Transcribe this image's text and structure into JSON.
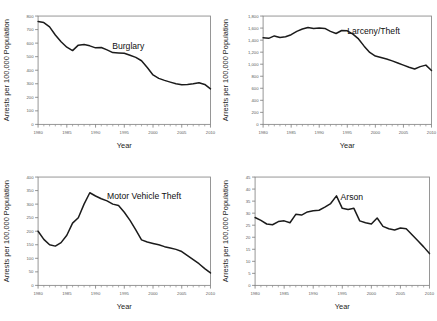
{
  "figure": {
    "background_color": "#ffffff",
    "line_color": "#1b1b1b",
    "axis_color": "#7a7a7a"
  },
  "chart_data": [
    {
      "type": "line",
      "title": "Burglary",
      "xlabel": "Year",
      "ylabel": "Arrests per 100,000 Population",
      "xlim": [
        1980,
        2010
      ],
      "ylim": [
        0,
        800
      ],
      "xticks": [
        1980,
        1985,
        1990,
        1995,
        2000,
        2005,
        2010
      ],
      "xtick_labels": [
        "1980",
        "1985",
        "1990",
        "1995",
        "2000",
        "2005",
        "2010"
      ],
      "yticks": [
        0,
        100,
        200,
        300,
        400,
        500,
        600,
        700,
        800
      ],
      "ytick_labels": [
        "0",
        "100",
        "200",
        "300",
        "400",
        "500",
        "600",
        "700",
        "800"
      ],
      "grid": false,
      "legend": "none",
      "x": [
        1980,
        1981,
        1982,
        1983,
        1984,
        1985,
        1986,
        1987,
        1988,
        1989,
        1990,
        1991,
        1992,
        1993,
        1994,
        1995,
        1996,
        1997,
        1998,
        1999,
        2000,
        2001,
        2002,
        2003,
        2004,
        2005,
        2006,
        2007,
        2008,
        2009,
        2010
      ],
      "values": [
        760,
        752,
        720,
        660,
        610,
        570,
        545,
        585,
        590,
        580,
        565,
        568,
        550,
        530,
        528,
        525,
        510,
        495,
        470,
        420,
        365,
        340,
        325,
        312,
        300,
        292,
        295,
        300,
        308,
        295,
        262
      ]
    },
    {
      "type": "line",
      "title": "Larceny/Theft",
      "xlabel": "Year",
      "ylabel": "Arrests per 100,000 Population",
      "xlim": [
        1980,
        2010
      ],
      "ylim": [
        0,
        1800
      ],
      "xticks": [
        1980,
        1985,
        1990,
        1995,
        2000,
        2005,
        2010
      ],
      "xtick_labels": [
        "1980",
        "1985",
        "1990",
        "1995",
        "2000",
        "2005",
        "2010"
      ],
      "yticks": [
        0,
        200,
        400,
        600,
        800,
        1000,
        1200,
        1400,
        1600,
        1800
      ],
      "ytick_labels": [
        "0",
        "200",
        "400",
        "600",
        "800",
        "1,000",
        "1,200",
        "1,400",
        "1,600",
        "1,800"
      ],
      "grid": false,
      "legend": "none",
      "x": [
        1980,
        1981,
        1982,
        1983,
        1984,
        1985,
        1986,
        1987,
        1988,
        1989,
        1990,
        1991,
        1992,
        1993,
        1994,
        1995,
        1996,
        1997,
        1998,
        1999,
        2000,
        2001,
        2002,
        2003,
        2004,
        2005,
        2006,
        2007,
        2008,
        2009,
        2010
      ],
      "values": [
        1440,
        1430,
        1470,
        1445,
        1455,
        1490,
        1545,
        1585,
        1610,
        1595,
        1600,
        1595,
        1545,
        1510,
        1560,
        1555,
        1500,
        1420,
        1300,
        1195,
        1135,
        1110,
        1085,
        1055,
        1020,
        985,
        950,
        920,
        960,
        985,
        895
      ]
    },
    {
      "type": "line",
      "title": "Motor Vehicle Theft",
      "xlabel": "Year",
      "ylabel": "Arrests per 100,000 Population",
      "xlim": [
        1980,
        2010
      ],
      "ylim": [
        0,
        400
      ],
      "xticks": [
        1980,
        1985,
        1990,
        1995,
        2000,
        2005,
        2010
      ],
      "xtick_labels": [
        "1980",
        "1985",
        "1990",
        "1995",
        "2000",
        "2005",
        "2010"
      ],
      "yticks": [
        0,
        50,
        100,
        150,
        200,
        250,
        300,
        350,
        400
      ],
      "ytick_labels": [
        "0",
        "50",
        "100",
        "150",
        "200",
        "250",
        "300",
        "350",
        "400"
      ],
      "grid": false,
      "legend": "none",
      "x": [
        1980,
        1981,
        1982,
        1983,
        1984,
        1985,
        1986,
        1987,
        1988,
        1989,
        1990,
        1991,
        1992,
        1993,
        1994,
        1995,
        1996,
        1997,
        1998,
        1999,
        2000,
        2001,
        2002,
        2003,
        2004,
        2005,
        2006,
        2007,
        2008,
        2009,
        2010
      ],
      "values": [
        200,
        170,
        150,
        145,
        158,
        185,
        230,
        250,
        300,
        342,
        330,
        320,
        312,
        300,
        295,
        270,
        240,
        205,
        168,
        160,
        155,
        150,
        143,
        138,
        133,
        125,
        110,
        95,
        80,
        62,
        46
      ]
    },
    {
      "type": "line",
      "title": "Arson",
      "xlabel": "Year",
      "ylabel": "Arrests per 100,000 Population",
      "xlim": [
        1980,
        2010
      ],
      "ylim": [
        0,
        45
      ],
      "xticks": [
        1980,
        1985,
        1990,
        1995,
        2000,
        2005,
        2010
      ],
      "xtick_labels": [
        "1980",
        "1985",
        "1990",
        "1995",
        "2000",
        "2005",
        "2010"
      ],
      "yticks": [
        0,
        5,
        10,
        15,
        20,
        25,
        30,
        35,
        40,
        45
      ],
      "ytick_labels": [
        "0",
        "5",
        "10",
        "15",
        "20",
        "25",
        "30",
        "35",
        "40",
        "45"
      ],
      "grid": false,
      "legend": "none",
      "x": [
        1980,
        1981,
        1982,
        1983,
        1984,
        1985,
        1986,
        1987,
        1988,
        1989,
        1990,
        1991,
        1992,
        1993,
        1994,
        1995,
        1996,
        1997,
        1998,
        1999,
        2000,
        2001,
        2002,
        2003,
        2004,
        2005,
        2006,
        2007,
        2008,
        2009,
        2010
      ],
      "values": [
        28.2,
        27.0,
        25.5,
        25.2,
        26.5,
        26.8,
        26.0,
        29.5,
        29.2,
        30.5,
        31.0,
        31.2,
        32.5,
        34.0,
        37.2,
        32.0,
        31.5,
        32.0,
        26.8,
        26.0,
        25.5,
        28.0,
        24.5,
        23.5,
        23.0,
        23.8,
        23.5,
        21.0,
        18.5,
        16.0,
        13.2
      ]
    }
  ]
}
